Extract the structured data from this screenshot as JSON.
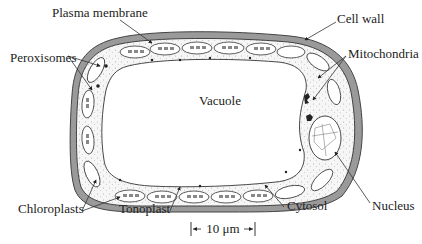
{
  "figure": {
    "colors": {
      "cell_wall": "#9a9a9a",
      "cell_wall_outline": "#444444",
      "cytosol": "#f4f4f4",
      "vacuole": "#ffffff",
      "ink": "#222222"
    }
  },
  "labels": {
    "plasma_membrane": "Plasma membrane",
    "cell_wall": "Cell wall",
    "peroxisomes": "Peroxisomes",
    "mitochondria": "Mitochondria",
    "vacuole": "Vacuole",
    "nucleus": "Nucleus",
    "chloroplasts": "Chloroplasts",
    "tonoplast": "Tonoplast",
    "cytosol": "Cytosol"
  },
  "scale_bar": {
    "label": "10 μm"
  }
}
